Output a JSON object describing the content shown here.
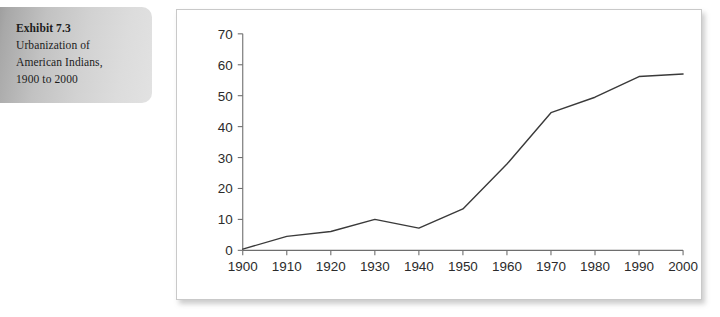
{
  "caption": {
    "title": "Exhibit 7.3",
    "lines": [
      "Urbanization of",
      "American Indians,",
      "1900 to 2000"
    ]
  },
  "colors": {
    "line": "#3a3a3a",
    "axis": "#6e6e6e",
    "panel_border": "#c9c9c9",
    "panel_background": "#ffffff",
    "caption_background_start": "#8f8f8f",
    "caption_background_end": "#e2e2e2",
    "text": "#1c1c1c"
  },
  "chart_data": {
    "type": "line",
    "title": "",
    "xlabel": "",
    "ylabel": "",
    "grid": false,
    "legend": "none",
    "xlim": [
      1900,
      2000
    ],
    "ylim": [
      0,
      70
    ],
    "x": [
      1900,
      1910,
      1920,
      1930,
      1940,
      1950,
      1960,
      1970,
      1980,
      1990,
      2000
    ],
    "xtick_labels": [
      "1900",
      "1910",
      "1920",
      "1930",
      "1940",
      "1950",
      "1960",
      "1970",
      "1980",
      "1990",
      "2000"
    ],
    "ytick_values": [
      0,
      10,
      20,
      30,
      40,
      50,
      60,
      70
    ],
    "ytick_labels": [
      "0",
      "10",
      "20",
      "30",
      "40",
      "50",
      "60",
      "70"
    ],
    "series": [
      {
        "name": "Percent urban",
        "values": [
          0.4,
          4.5,
          6.1,
          10.0,
          7.2,
          13.4,
          27.9,
          44.5,
          49.5,
          56.2,
          57.0
        ]
      }
    ]
  }
}
